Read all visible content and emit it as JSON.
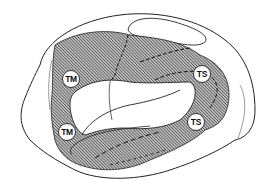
{
  "diagram": {
    "type": "brain lateral surface schematic with hatched cortical region",
    "labels": [
      {
        "id": "tm_upper",
        "text": "TM"
      },
      {
        "id": "tm_lower",
        "text": "TM"
      },
      {
        "id": "ts_upper",
        "text": "TS"
      },
      {
        "id": "ts_lower",
        "text": "TS"
      }
    ],
    "colors": {
      "outline": "#222222",
      "hatch": "#444444",
      "background": "#ffffff"
    }
  }
}
